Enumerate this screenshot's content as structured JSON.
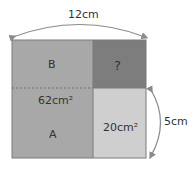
{
  "diagram": {
    "type": "area-puzzle",
    "outer_square": {
      "side_label": "12cm"
    },
    "regions": [
      {
        "id": "B",
        "label": "B",
        "color": "#a8a8a8"
      },
      {
        "id": "unknown",
        "label": "?",
        "color": "#7d7d7d"
      },
      {
        "id": "A",
        "label": "A",
        "area_label": "62cm²",
        "color": "#a8a8a8"
      },
      {
        "id": "C",
        "area_label": "20cm²",
        "color": "#cfcfcf"
      }
    ],
    "dimensions": {
      "top_width": "12cm",
      "right_height": "5cm"
    },
    "colors": {
      "arrow": "#8a8a8a",
      "border": "#7a7a7a",
      "divider_dashed": "#6f6f6f"
    }
  }
}
